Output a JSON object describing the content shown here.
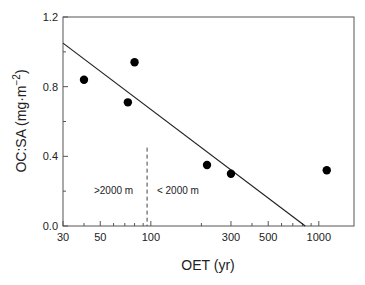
{
  "chart_data": {
    "type": "scatter",
    "title": "",
    "xlabel": "OET (yr)",
    "ylabel": "OC:SA (mg·m⁻²)",
    "ylabel_parts": {
      "main": "OC:SA (mg·m",
      "sup": "−2",
      "close": ")"
    },
    "xscale": "log",
    "xlim": [
      30,
      1620
    ],
    "ylim": [
      0.0,
      1.2
    ],
    "xticks": [
      30,
      50,
      100,
      300,
      500,
      1000
    ],
    "xtick_labels": [
      "30",
      "50",
      "100",
      "300",
      "500",
      "1000"
    ],
    "xminor_ticks": [
      40,
      60,
      70,
      80,
      90,
      200,
      400,
      600,
      700,
      800,
      900
    ],
    "yticks": [
      0.0,
      0.4,
      0.8,
      1.2
    ],
    "ytick_labels": [
      "0.0",
      "0.4",
      "0.8",
      "1.2"
    ],
    "yminor_ticks": [
      0.2,
      0.6,
      1.0
    ],
    "grid": false,
    "legend": null,
    "points": [
      {
        "x": 40,
        "y": 0.84
      },
      {
        "x": 73,
        "y": 0.71
      },
      {
        "x": 80,
        "y": 0.94
      },
      {
        "x": 216,
        "y": 0.35
      },
      {
        "x": 300,
        "y": 0.3
      },
      {
        "x": 1115,
        "y": 0.32
      }
    ],
    "regression_line": {
      "x": [
        30,
        830
      ],
      "y": [
        1.05,
        0.0
      ]
    },
    "divider": {
      "x": 95,
      "y_range": [
        0.0,
        0.45
      ],
      "style": "dashed"
    },
    "annotations": [
      {
        "text": ">2000 m",
        "x": 60,
        "y": 0.2,
        "anchor": "middle"
      },
      {
        "text": "< 2000 m",
        "x": 145,
        "y": 0.2,
        "anchor": "middle"
      }
    ]
  }
}
